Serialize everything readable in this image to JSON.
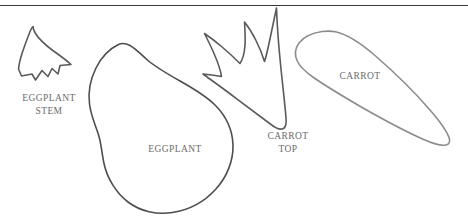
{
  "page": {
    "background_color": "#ffffff",
    "width": 468,
    "height": 219
  },
  "divider": {
    "name": "top-rule",
    "color": "#3a3a3a",
    "y": 5
  },
  "labels": {
    "eggplant_stem": "EGGPLANT\nSTEM",
    "eggplant": "EGGPLANT",
    "carrot_top": "CARROT\nTOP",
    "carrot": "CARROT",
    "text_color": "#6b6b6b"
  },
  "shapes": [
    {
      "name": "eggplant-stem",
      "label": "EGGPLANT STEM",
      "stroke": "#5a5a5a",
      "stroke_width": 1.6,
      "description": "jagged leafy calyx crown with pointed upper-left spike and zigzag lower edge"
    },
    {
      "name": "eggplant-body",
      "label": "EGGPLANT",
      "stroke": "#4e4e4e",
      "stroke_width": 1.6,
      "description": "large pear / teardrop outline, narrow rounded neck at upper-left widening to a round bulb at bottom"
    },
    {
      "name": "carrot-top",
      "label": "CARROT TOP",
      "stroke": "#5a5a5a",
      "stroke_width": 1.6,
      "description": "three-pronged leafy frond tapering to a single point at the bottom"
    },
    {
      "name": "carrot-body",
      "label": "CARROT",
      "stroke": "#8c8c8c",
      "stroke_width": 1.6,
      "description": "elongated tapering cone, rounded at upper-left, sharp point at lower-right"
    }
  ]
}
